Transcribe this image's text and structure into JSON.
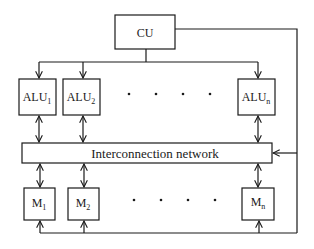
{
  "diagram": {
    "control_unit": {
      "label": "CU"
    },
    "alus": [
      {
        "base": "ALU",
        "sub": "1"
      },
      {
        "base": "ALU",
        "sub": "2"
      },
      {
        "base": "ALU",
        "sub": "n"
      }
    ],
    "memories": [
      {
        "base": "M",
        "sub": "1"
      },
      {
        "base": "M",
        "sub": "2"
      },
      {
        "base": "M",
        "sub": "n"
      }
    ],
    "network": {
      "label": "Interconnection network"
    },
    "ellipsis": "· · · ·",
    "colors": {
      "line": "#1a1a1a",
      "background": "#ffffff"
    }
  }
}
